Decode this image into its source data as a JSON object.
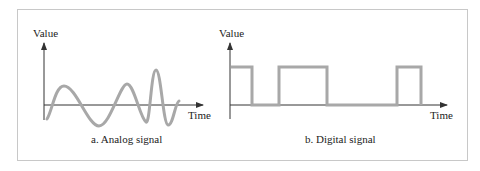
{
  "figure": {
    "frame_color": "#c8c8c8",
    "axis_color": "#333333",
    "signal_color": "#a8a8a8"
  },
  "analog": {
    "y_label": "Value",
    "x_label": "Time",
    "caption": "a. Analog signal"
  },
  "digital": {
    "y_label": "Value",
    "x_label": "Time",
    "caption": "b. Digital signal",
    "levels": [
      "high",
      "low",
      "high",
      "low",
      "high",
      "low"
    ]
  }
}
